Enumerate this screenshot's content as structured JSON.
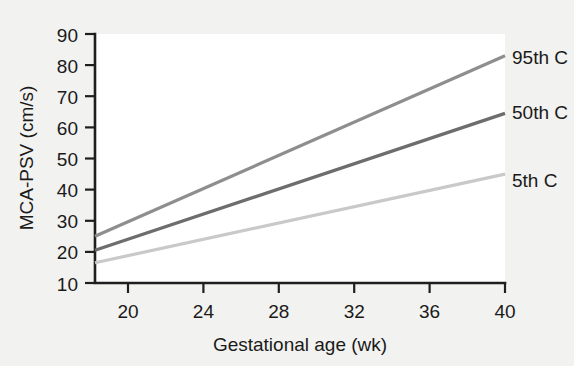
{
  "figure": {
    "background_color": "#f2f2f0",
    "plot_background_color": "#ffffff",
    "axis_color": "#1f1f1f"
  },
  "chart_data": {
    "type": "line",
    "title": "",
    "xlabel": "Gestational age (wk)",
    "ylabel": "MCA-PSV (cm/s)",
    "xlim": [
      19,
      40
    ],
    "ylim": [
      10,
      90
    ],
    "xticks": [
      20,
      24,
      28,
      32,
      36,
      40
    ],
    "yticks": [
      10,
      20,
      30,
      40,
      50,
      60,
      70,
      80,
      90
    ],
    "xtick_labels": [
      "20",
      "24",
      "28",
      "32",
      "36",
      "40"
    ],
    "ytick_labels": [
      "10",
      "20",
      "30",
      "40",
      "50",
      "60",
      "70",
      "80",
      "90"
    ],
    "grid": false,
    "legend_position": "right-inline-labels",
    "x": [
      19,
      40
    ],
    "series": [
      {
        "name": "95th C",
        "label": "95th C",
        "color": "#8e8e8e",
        "values": [
          25,
          83
        ],
        "linewidth": 3.2
      },
      {
        "name": "50th C",
        "label": "50th C",
        "color": "#6d6d6d",
        "values": [
          20.5,
          64.5
        ],
        "linewidth": 3.2
      },
      {
        "name": "5th C",
        "label": "5th C",
        "color": "#c9c9c9",
        "values": [
          16.5,
          45
        ],
        "linewidth": 3.2
      }
    ],
    "annotations": [
      {
        "text": "95th C",
        "series": "95th C",
        "x": 40,
        "y": 83
      },
      {
        "text": "50th C",
        "series": "50th C",
        "x": 40,
        "y": 64.5
      },
      {
        "text": "5th C",
        "series": "5th C",
        "x": 40,
        "y": 45
      }
    ]
  }
}
